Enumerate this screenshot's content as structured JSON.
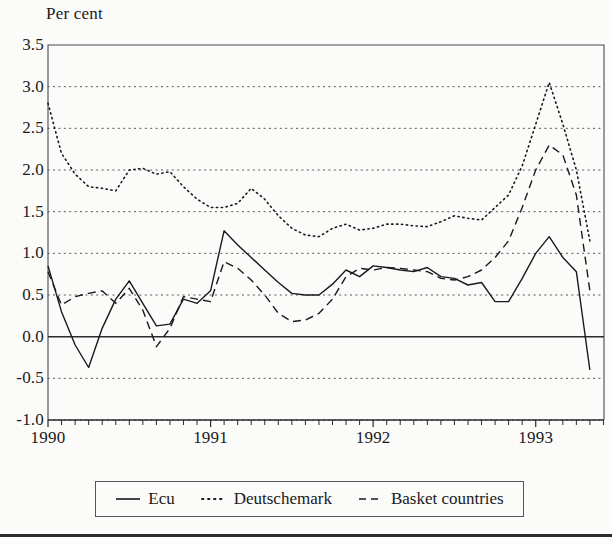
{
  "axis_title": "Per cent",
  "legend": {
    "entries": [
      {
        "label": "Ecu",
        "style": "solid",
        "icon": "solid-line-icon"
      },
      {
        "label": "Deutschemark",
        "style": "dotted",
        "icon": "dotted-line-icon"
      },
      {
        "label": "Basket countries",
        "style": "dashed",
        "icon": "dashed-line-icon"
      }
    ]
  },
  "chart_data": {
    "type": "line",
    "title": "",
    "subtitle": "",
    "xlabel": "",
    "ylabel": "Per cent",
    "ylim": [
      -1.0,
      3.5
    ],
    "xlim": [
      1990.0,
      1993.42
    ],
    "grid": true,
    "grid_style": "dotted-horizontal",
    "zero_line": true,
    "legend_position": "below",
    "ytick_labels": [
      "3.5",
      "3.0",
      "2.5",
      "2.0",
      "1.5",
      "1.0",
      "0.5",
      "0.0",
      "-0.5",
      "-1.0"
    ],
    "ytick_values": [
      3.5,
      3.0,
      2.5,
      2.0,
      1.5,
      1.0,
      0.5,
      0.0,
      -0.5,
      -1.0
    ],
    "xtick_labels": [
      "1990",
      "1991",
      "1992",
      "1993"
    ],
    "xtick_values": [
      1990,
      1991,
      1992,
      1993
    ],
    "minor_xticks_per_year": 12,
    "x": [
      1990.0,
      1990.083,
      1990.167,
      1990.25,
      1990.333,
      1990.417,
      1990.5,
      1990.583,
      1990.667,
      1990.75,
      1990.833,
      1990.917,
      1991.0,
      1991.083,
      1991.167,
      1991.25,
      1991.333,
      1991.417,
      1991.5,
      1991.583,
      1991.667,
      1991.75,
      1991.833,
      1991.917,
      1992.0,
      1992.083,
      1992.167,
      1992.25,
      1992.333,
      1992.417,
      1992.5,
      1992.583,
      1992.667,
      1992.75,
      1992.833,
      1992.917,
      1993.0,
      1993.083,
      1993.167,
      1993.25,
      1993.333
    ],
    "series": [
      {
        "name": "Ecu",
        "style": "solid",
        "values": [
          0.85,
          0.3,
          -0.1,
          -0.37,
          0.1,
          0.45,
          0.67,
          0.4,
          0.13,
          0.15,
          0.45,
          0.4,
          0.55,
          1.27,
          1.1,
          0.95,
          0.8,
          0.65,
          0.52,
          0.5,
          0.5,
          0.63,
          0.8,
          0.72,
          0.85,
          0.83,
          0.8,
          0.78,
          0.83,
          0.72,
          0.7,
          0.62,
          0.65,
          0.42,
          0.42,
          0.7,
          1.0,
          1.2,
          0.95,
          0.78,
          -0.4
        ]
      },
      {
        "name": "Deutschemark",
        "style": "dotted",
        "values": [
          2.8,
          2.2,
          1.95,
          1.8,
          1.78,
          1.75,
          2.0,
          2.02,
          1.95,
          1.98,
          1.8,
          1.65,
          1.55,
          1.55,
          1.6,
          1.78,
          1.65,
          1.45,
          1.3,
          1.22,
          1.2,
          1.3,
          1.35,
          1.28,
          1.3,
          1.35,
          1.35,
          1.33,
          1.32,
          1.38,
          1.45,
          1.42,
          1.4,
          1.55,
          1.7,
          2.05,
          2.55,
          3.05,
          2.55,
          2.0,
          1.15
        ]
      },
      {
        "name": "Basket countries",
        "style": "dashed",
        "values": [
          0.78,
          0.38,
          0.48,
          0.52,
          0.55,
          0.4,
          0.58,
          0.32,
          -0.12,
          0.1,
          0.48,
          0.45,
          0.42,
          0.9,
          0.82,
          0.68,
          0.5,
          0.28,
          0.18,
          0.2,
          0.28,
          0.45,
          0.72,
          0.82,
          0.8,
          0.83,
          0.82,
          0.8,
          0.78,
          0.7,
          0.68,
          0.72,
          0.8,
          0.95,
          1.15,
          1.55,
          2.0,
          2.3,
          2.18,
          1.7,
          0.55
        ]
      }
    ]
  },
  "plot_geometry": {
    "left": 48,
    "right": 604,
    "top": 45,
    "bottom": 420
  }
}
